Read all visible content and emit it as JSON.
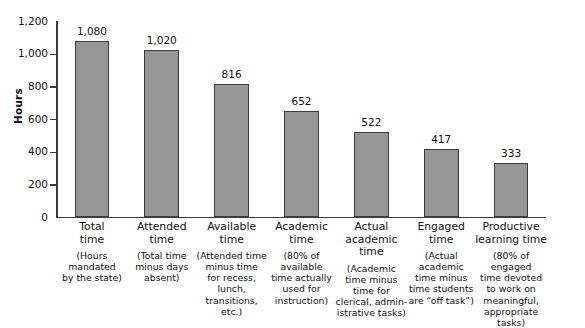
{
  "chart_data": {
    "type": "bar",
    "title": "",
    "xlabel": "",
    "ylabel": "Hours",
    "ylim": [
      0,
      1200
    ],
    "yticks": [
      "0",
      "200",
      "400",
      "600",
      "800",
      "1,000",
      "1,200"
    ],
    "ytick_values": [
      0,
      200,
      400,
      600,
      800,
      1000,
      1200
    ],
    "grid": false,
    "legend": "none",
    "categories": [
      "Total time",
      "Attended time",
      "Available time",
      "Academic time",
      "Actual academic time",
      "Engaged time",
      "Productive learning time"
    ],
    "values": [
      1080,
      1020,
      816,
      652,
      522,
      417,
      333
    ],
    "value_labels": [
      "1,080",
      "1,020",
      "816",
      "652",
      "522",
      "417",
      "333"
    ],
    "bars": [
      {
        "title_lines": [
          "Total",
          "time"
        ],
        "desc_lines": [
          "(Hours",
          "mandated",
          "by the state)"
        ],
        "value": 1080,
        "value_label": "1,080"
      },
      {
        "title_lines": [
          "Attended",
          "time"
        ],
        "desc_lines": [
          "(Total time",
          "minus days",
          "absent)"
        ],
        "value": 1020,
        "value_label": "1,020"
      },
      {
        "title_lines": [
          "Available",
          "time"
        ],
        "desc_lines": [
          "(Attended time",
          "minus time",
          "for recess, lunch,",
          "transitions, etc.)"
        ],
        "value": 816,
        "value_label": "816"
      },
      {
        "title_lines": [
          "Academic",
          "time"
        ],
        "desc_lines": [
          "(80% of",
          "available",
          "time actually",
          "used for",
          "instruction)"
        ],
        "value": 652,
        "value_label": "652"
      },
      {
        "title_lines": [
          "Actual",
          "academic time"
        ],
        "desc_lines": [
          "(Academic",
          "time minus",
          "time for",
          "clerical, admin-",
          "istrative tasks)"
        ],
        "value": 522,
        "value_label": "522"
      },
      {
        "title_lines": [
          "Engaged",
          "time"
        ],
        "desc_lines": [
          "(Actual",
          "academic",
          "time minus",
          "time students",
          "are “off task”)"
        ],
        "value": 417,
        "value_label": "417"
      },
      {
        "title_lines": [
          "Productive",
          "learning time"
        ],
        "desc_lines": [
          "(80% of engaged",
          "time devoted",
          "to work on",
          "meaningful,",
          "appropriate tasks)"
        ],
        "value": 333,
        "value_label": "333"
      }
    ],
    "colors": {
      "bar_fill": "#969696",
      "bar_stroke": "#3d3d3d",
      "axis": "#3a3a3a",
      "text": "#111111",
      "background": "#ffffff"
    }
  }
}
